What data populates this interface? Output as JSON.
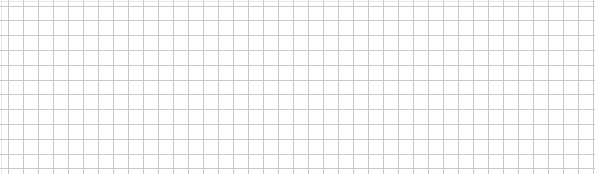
{
  "canvas": {
    "width": 595,
    "height": 174,
    "background": "#ffffff"
  },
  "grid": {
    "line_color": "#c9c9c9",
    "edge_line_color": "#e6e6e6",
    "vertical": {
      "start": 8,
      "spacing": 15,
      "count": 40
    },
    "horizontal": {
      "start": 5.5,
      "spacing": 14.8,
      "count": 12
    },
    "edge_lines": {
      "top_y": 1,
      "left_x": 1
    }
  }
}
